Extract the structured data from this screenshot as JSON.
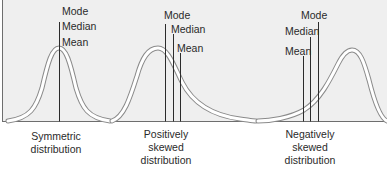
{
  "panels": [
    {
      "id": "symmetric",
      "caption": [
        "Symmetric",
        "distribution"
      ],
      "labels": {
        "mode": "Mode",
        "median": "Median",
        "mean": "Mean"
      }
    },
    {
      "id": "positive",
      "caption": [
        "Positively",
        "skewed",
        "distribution"
      ],
      "labels": {
        "mode": "Mode",
        "median": "Median",
        "mean": "Mean"
      }
    },
    {
      "id": "negative",
      "caption": [
        "Negatively",
        "skewed",
        "distribution"
      ],
      "labels": {
        "mode": "Mode",
        "median": "Median",
        "mean": "Mean"
      }
    }
  ],
  "colors": {
    "background": "#efefef",
    "axis": "#6e6e6e",
    "curve_outline": "#8a8a8a",
    "curve_fill": "#ffffff",
    "marker_line": "#2b2b2b",
    "text": "#2a2a2a"
  }
}
